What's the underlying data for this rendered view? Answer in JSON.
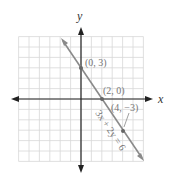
{
  "chart_data": {
    "type": "line",
    "title": "",
    "xlabel": "x",
    "ylabel": "y",
    "xlim": [
      -6,
      6
    ],
    "ylim": [
      -6,
      6
    ],
    "grid": true,
    "series": [
      {
        "name": "3x + 2y = 6",
        "equation": "3x + 2y = 6",
        "x": [
          -3,
          7
        ],
        "y": [
          7.5,
          -7.5
        ]
      }
    ],
    "points": [
      {
        "x": 0,
        "y": 3,
        "label": "(0, 3)"
      },
      {
        "x": 2,
        "y": 0,
        "label": "(2, 0)"
      },
      {
        "x": 4,
        "y": -3,
        "label": "(4, −3)"
      }
    ],
    "annotations": [
      "3x + 2y = 6"
    ]
  },
  "labels": {
    "x_axis": "x",
    "y_axis": "y",
    "p1": "(0, 3)",
    "p2": "(2, 0)",
    "p3": "(4, −3)",
    "equation": "3x + 2y = 6"
  },
  "colors": {
    "grid": "#d8d8d8",
    "axis": "#222222",
    "line": "#8a8a8a",
    "text": "#777777"
  }
}
